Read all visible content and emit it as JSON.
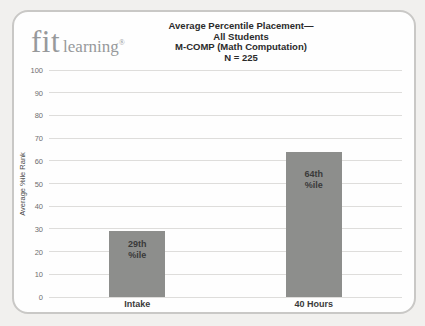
{
  "logo": {
    "brand": "fit",
    "suffix": "learning",
    "registered_mark": "®",
    "color": "#97999b"
  },
  "header": {
    "title_lines": [
      "Average Percentile Placement—",
      "All Students",
      "M-COMP (Math Computation)",
      "N = 225"
    ]
  },
  "chart_data": {
    "type": "bar",
    "title": "Average Percentile Placement— All Students M-COMP (Math Computation) N = 225",
    "categories": [
      "Intake",
      "40 Hours"
    ],
    "values": [
      29,
      64
    ],
    "bar_labels": [
      [
        "29th",
        "%ile"
      ],
      [
        "64th",
        "%ile"
      ]
    ],
    "xlabel": "",
    "ylabel": "Average %ile Rank",
    "ylim": [
      0,
      100
    ],
    "yticks": [
      0,
      10,
      20,
      30,
      40,
      50,
      60,
      70,
      80,
      90,
      100
    ],
    "grid": true,
    "legend": false,
    "bar_color": "#8d8e8c",
    "bar_label_color": "#3a3a3a",
    "gridline_color": "#dedddb",
    "tick_color": "#6e6e6e"
  }
}
